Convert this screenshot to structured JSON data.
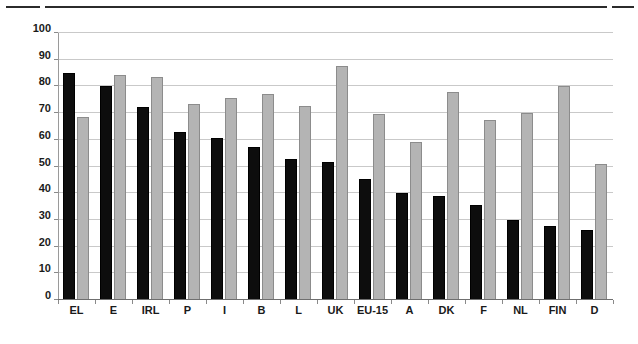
{
  "chart_data": {
    "type": "bar",
    "title": "",
    "subtitle": "",
    "xlabel": "",
    "ylabel": "",
    "ylim": [
      0,
      100
    ],
    "yticks": [
      0,
      10,
      20,
      30,
      40,
      50,
      60,
      70,
      80,
      90,
      100
    ],
    "grid": true,
    "legend": "none",
    "categories": [
      "EL",
      "E",
      "IRL",
      "P",
      "I",
      "B",
      "L",
      "UK",
      "EU-15",
      "A",
      "DK",
      "F",
      "NL",
      "FIN",
      "D"
    ],
    "series": [
      {
        "name": "series-1",
        "color": "#0d0d0d",
        "values": [
          85,
          80.3,
          72.2,
          63,
          60.6,
          57.3,
          52.8,
          51.8,
          45.2,
          40,
          39,
          35.6,
          29.8,
          27.9,
          26.4
        ]
      },
      {
        "name": "series-2",
        "color": "#b4b4b4",
        "values": [
          68.5,
          84.3,
          83.4,
          73.5,
          75.8,
          77.1,
          72.8,
          87.6,
          69.6,
          59,
          78,
          67.5,
          69.9,
          80,
          50.8
        ]
      }
    ]
  },
  "decorations": {
    "top_rule_present": true
  }
}
